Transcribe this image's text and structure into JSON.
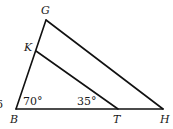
{
  "diagram": {
    "type": "triangle-with-parallel-segment",
    "points": {
      "G": {
        "label": "G",
        "x": 46,
        "y": 20
      },
      "K": {
        "label": "K",
        "x": 36,
        "y": 51
      },
      "B": {
        "label": "B",
        "x": 16,
        "y": 109
      },
      "T": {
        "label": "T",
        "x": 118,
        "y": 109
      },
      "H": {
        "label": "H",
        "x": 163,
        "y": 109
      }
    },
    "segments": [
      {
        "name": "BG",
        "from": "B",
        "to": "G"
      },
      {
        "name": "GH",
        "from": "G",
        "to": "H"
      },
      {
        "name": "BH",
        "from": "B",
        "to": "H"
      },
      {
        "name": "KT",
        "from": "K",
        "to": "T"
      }
    ],
    "angles": {
      "at_B": "70°",
      "at_T": "35°"
    },
    "edge_fragment": "6",
    "colors": {
      "stroke": "#111111",
      "text": "#1a1a1a",
      "background": "#ffffff"
    }
  }
}
